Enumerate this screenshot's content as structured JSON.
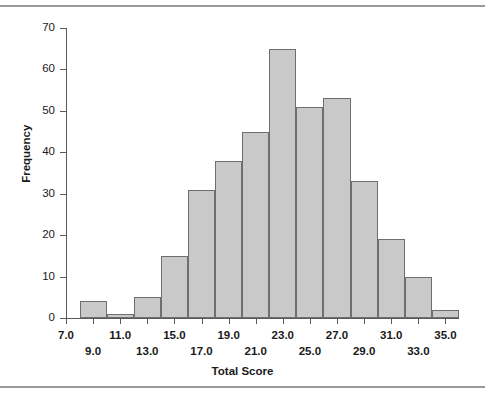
{
  "figure": {
    "background_color": "#ffffff",
    "rule_color": "#999999",
    "top_rule_label": "top-horizontal-rule",
    "bottom_rule_label": "bottom-horizontal-rule"
  },
  "chart_data": {
    "type": "bar",
    "title": "",
    "subtitle": "",
    "xlabel": "Total Score",
    "ylabel": "Frequency",
    "bar_fill_color": "#c9c9c9",
    "bar_border_color": "#6e6e6e",
    "axis_color": "#5a5a5a",
    "grid": false,
    "legend": false,
    "legend_position": "none",
    "xlim": [
      7.0,
      36.0
    ],
    "ylim": [
      0,
      70
    ],
    "bin_width": 2.0,
    "x_tick_labels": [
      "7.0",
      "9.0",
      "11.0",
      "13.0",
      "15.0",
      "17.0",
      "19.0",
      "21.0",
      "23.0",
      "25.0",
      "27.0",
      "29.0",
      "31.0",
      "33.0",
      "35.0"
    ],
    "x_tick_values": [
      7.0,
      9.0,
      11.0,
      13.0,
      15.0,
      17.0,
      19.0,
      21.0,
      23.0,
      25.0,
      27.0,
      29.0,
      31.0,
      33.0,
      35.0
    ],
    "y_tick_labels": [
      "0",
      "10",
      "20",
      "30",
      "40",
      "50",
      "60",
      "70"
    ],
    "y_tick_values": [
      0,
      10,
      20,
      30,
      40,
      50,
      60,
      70
    ],
    "categories": [
      "8-10",
      "10-12",
      "12-14",
      "14-16",
      "16-18",
      "18-20",
      "20-22",
      "22-24",
      "24-26",
      "26-28",
      "28-30",
      "30-32",
      "32-34",
      "34-36"
    ],
    "bin_starts": [
      8,
      10,
      12,
      14,
      16,
      18,
      20,
      22,
      24,
      26,
      28,
      30,
      32,
      34
    ],
    "values": [
      4,
      1,
      5,
      15,
      31,
      38,
      45,
      65,
      51,
      53,
      33,
      19,
      10,
      2
    ]
  }
}
